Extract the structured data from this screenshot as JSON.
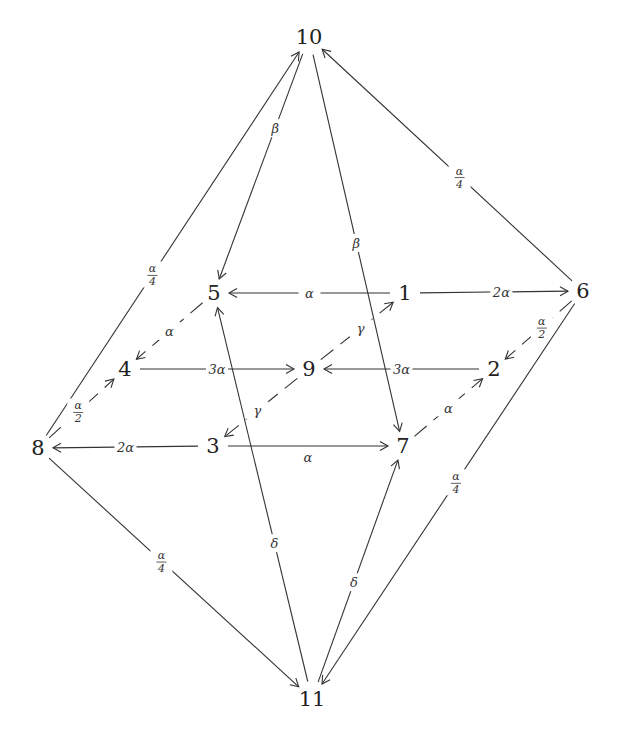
{
  "diagram": {
    "type": "directed-graph",
    "nodes": [
      {
        "id": "1",
        "label": "1",
        "x": 405,
        "y": 300
      },
      {
        "id": "2",
        "label": "2",
        "x": 494,
        "y": 376
      },
      {
        "id": "3",
        "label": "3",
        "x": 213,
        "y": 453
      },
      {
        "id": "4",
        "label": "4",
        "x": 125,
        "y": 376
      },
      {
        "id": "5",
        "label": "5",
        "x": 214,
        "y": 300
      },
      {
        "id": "6",
        "label": "6",
        "x": 583,
        "y": 298
      },
      {
        "id": "7",
        "label": "7",
        "x": 403,
        "y": 453
      },
      {
        "id": "8",
        "label": "8",
        "x": 38,
        "y": 455
      },
      {
        "id": "9",
        "label": "9",
        "x": 309,
        "y": 376
      },
      {
        "id": "10",
        "label": "10",
        "x": 309,
        "y": 44
      },
      {
        "id": "11",
        "label": "11",
        "x": 312,
        "y": 706
      }
    ],
    "edges": [
      {
        "from": "10",
        "to": "5",
        "label": "β",
        "t": 0.33,
        "dash": false
      },
      {
        "from": "10",
        "to": "7",
        "label": "β",
        "t": 0.5,
        "dash": false
      },
      {
        "from": "8",
        "to": "10",
        "label": "α/4",
        "t": 0.42,
        "dash": false
      },
      {
        "from": "6",
        "to": "10",
        "label": "α/4",
        "t": 0.45,
        "dash": false
      },
      {
        "from": "1",
        "to": "5",
        "label": "α",
        "t": 0.5,
        "dash": false
      },
      {
        "from": "1",
        "to": "6",
        "label": "2α",
        "t": 0.55,
        "dash": false
      },
      {
        "from": "5",
        "to": "4",
        "label": "α",
        "t": 0.5,
        "dash": true
      },
      {
        "from": "6",
        "to": "2",
        "label": "α/2",
        "t": 0.45,
        "dash": true
      },
      {
        "from": "4",
        "to": "9",
        "label": "3α",
        "t": 0.5,
        "dash": false
      },
      {
        "from": "2",
        "to": "9",
        "label": "3α",
        "t": 0.5,
        "dash": false
      },
      {
        "from": "9",
        "to": "1",
        "label": "γ",
        "t": 0.55,
        "dash": true
      },
      {
        "from": "9",
        "to": "3",
        "label": "γ",
        "t": 0.55,
        "dash": true
      },
      {
        "from": "8",
        "to": "4",
        "label": "α/2",
        "t": 0.45,
        "dash": true
      },
      {
        "from": "3",
        "to": "8",
        "label": "2α",
        "t": 0.5,
        "dash": false
      },
      {
        "from": "3",
        "to": "7",
        "label": "α",
        "t": 0.5,
        "dash": false,
        "label_below": true
      },
      {
        "from": "7",
        "to": "2",
        "label": "α",
        "t": 0.5,
        "dash": true
      },
      {
        "from": "11",
        "to": "5",
        "label": "δ",
        "t": 0.37,
        "dash": false
      },
      {
        "from": "11",
        "to": "7",
        "label": "δ",
        "t": 0.45,
        "dash": false
      },
      {
        "from": "8",
        "to": "11",
        "label": "α/4",
        "t": 0.45,
        "dash": false
      },
      {
        "from": "6",
        "to": "11",
        "label": "α/4",
        "t": 0.47,
        "dash": false
      }
    ]
  }
}
